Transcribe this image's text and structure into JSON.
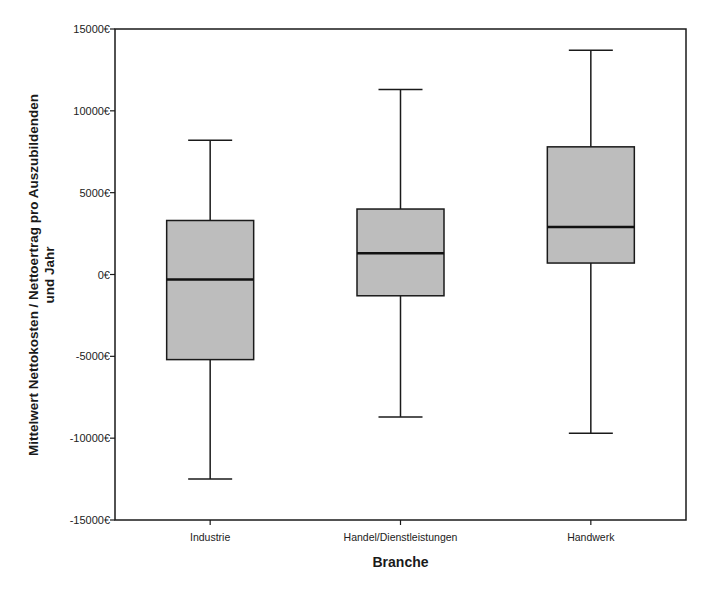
{
  "chart_data": {
    "type": "boxplot",
    "title": "",
    "xlabel": "Branche",
    "ylabel_lines": [
      "Mittelwert Nettokosten / Nettoertrag pro Auszubildenden",
      "und Jahr"
    ],
    "ylim": [
      -15000,
      15000
    ],
    "yticks": [
      15000,
      10000,
      5000,
      0,
      -5000,
      -10000,
      -15000
    ],
    "ytick_labels": [
      "15000€",
      "10000€",
      "5000€",
      "0€",
      "-5000€",
      "-10000€",
      "-15000€"
    ],
    "categories": [
      "Industrie",
      "Handel/Dienstleistungen",
      "Handwerk"
    ],
    "series": [
      {
        "name": "Industrie",
        "whisker_low": -12500,
        "q1": -5200,
        "median": -300,
        "q3": 3300,
        "whisker_high": 8200
      },
      {
        "name": "Handel/Dienstleistungen",
        "whisker_low": -8700,
        "q1": -1300,
        "median": 1300,
        "q3": 4000,
        "whisker_high": 11300
      },
      {
        "name": "Handwerk",
        "whisker_low": -9700,
        "q1": 700,
        "median": 2900,
        "q3": 7800,
        "whisker_high": 13700
      }
    ],
    "grid": false,
    "legend": null,
    "colors": {
      "box_fill": "#bdbdbd",
      "line": "#1a1a1a",
      "background": "#ffffff"
    }
  }
}
